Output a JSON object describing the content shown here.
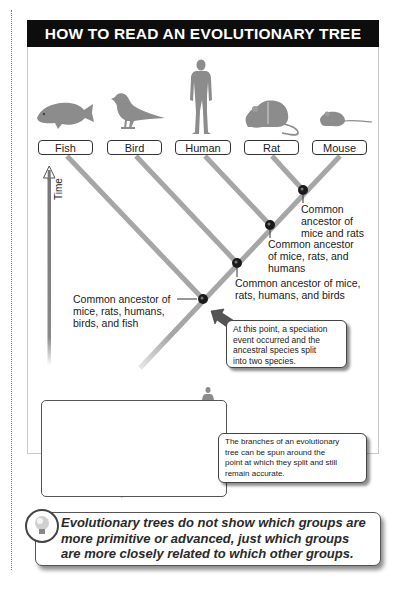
{
  "title": "HOW TO READ AN EVOLUTIONARY TREE",
  "taxa": [
    {
      "label": "Fish",
      "icon": "fish-icon"
    },
    {
      "label": "Bird",
      "icon": "bird-icon"
    },
    {
      "label": "Human",
      "icon": "human-icon"
    },
    {
      "label": "Rat",
      "icon": "rat-icon"
    },
    {
      "label": "Mouse",
      "icon": "mouse-icon"
    }
  ],
  "axis": {
    "label": "Time",
    "direction": "up"
  },
  "nodes": [
    {
      "id": "mice-rats",
      "label_lines": [
        "Common",
        "ancestor of",
        "mice and rats"
      ]
    },
    {
      "id": "mice-rats-humans",
      "label_lines": [
        "Common ancestor",
        "of mice, rats, and",
        "humans"
      ]
    },
    {
      "id": "mice-rats-humans-birds",
      "label_lines": [
        "Common ancestor of mice,",
        "rats, humans, and birds"
      ]
    },
    {
      "id": "mice-rats-humans-birds-fish",
      "label_lines": [
        "Common ancestor of",
        "mice, rats, humans,",
        "birds, and fish"
      ]
    }
  ],
  "callouts": {
    "speciation": [
      "At this point, a speciation",
      "event occurred and the",
      "ancestral species split",
      "into two species."
    ],
    "rotation": [
      "The branches of an evolutionary",
      "tree can be spun around the",
      "point at which they split and still",
      "remain accurate."
    ]
  },
  "inset": {
    "order": [
      "Fish",
      "Bird",
      "Mouse",
      "Rat",
      "Human"
    ]
  },
  "note": {
    "icon": "light-bulb-icon",
    "lines": [
      "Evolutionary trees do not show which groups are",
      "more primitive or advanced, just which groups",
      "are more closely related to which other groups."
    ]
  },
  "colors": {
    "branch": "#a6a6a6",
    "node": "#1a1a1a",
    "header_bg": "#0d0d0d",
    "silhouette": "#8c8c8c",
    "arrow": "#555555"
  }
}
